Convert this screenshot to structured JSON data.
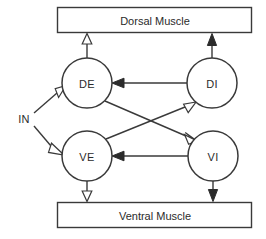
{
  "diagram": {
    "colors": {
      "stroke": "#3a3a3a",
      "fill": "#ffffff",
      "text": "#2b2b2b",
      "filled_arrow": "#2b2b2b"
    },
    "muscles": [
      {
        "id": "dorsal-muscle",
        "label": "Dorsal Muscle",
        "x": 57,
        "y": 7,
        "width": 195,
        "height": 26
      },
      {
        "id": "ventral-muscle",
        "label": "Ventral Muscle",
        "x": 57,
        "y": 202,
        "width": 195,
        "height": 26
      }
    ],
    "neurons": [
      {
        "id": "DE",
        "label": "DE",
        "cx": 87,
        "cy": 83,
        "r": 25
      },
      {
        "id": "DI",
        "label": "DI",
        "cx": 212,
        "cy": 83,
        "r": 25
      },
      {
        "id": "VE",
        "label": "VE",
        "cx": 87,
        "cy": 156,
        "r": 25
      },
      {
        "id": "VI",
        "label": "VI",
        "cx": 213,
        "cy": 156,
        "r": 25
      }
    ],
    "input": {
      "id": "IN",
      "label": "IN",
      "x": 24,
      "y": 119
    },
    "connections": [
      {
        "id": "de-to-dorsal-muscle",
        "from": "DE",
        "to": "dorsal-muscle",
        "arrow": "open",
        "direction": "up"
      },
      {
        "id": "di-to-dorsal-muscle",
        "from": "DI",
        "to": "dorsal-muscle",
        "arrow": "filled",
        "direction": "up"
      },
      {
        "id": "ve-to-ventral-muscle",
        "from": "VE",
        "to": "ventral-muscle",
        "arrow": "open",
        "direction": "down"
      },
      {
        "id": "vi-to-ventral-muscle",
        "from": "VI",
        "to": "ventral-muscle",
        "arrow": "filled",
        "direction": "down"
      },
      {
        "id": "in-to-de",
        "from": "IN",
        "to": "DE",
        "arrow": "open",
        "direction": "up-right"
      },
      {
        "id": "in-to-ve",
        "from": "IN",
        "to": "VE",
        "arrow": "open",
        "direction": "down-right"
      },
      {
        "id": "di-to-de",
        "from": "DI",
        "to": "DE",
        "arrow": "filled",
        "direction": "left"
      },
      {
        "id": "vi-to-ve",
        "from": "VI",
        "to": "VE",
        "arrow": "filled",
        "direction": "left"
      },
      {
        "id": "de-to-vi",
        "from": "DE",
        "to": "VI",
        "arrow": "open",
        "direction": "down-right"
      },
      {
        "id": "ve-to-di",
        "from": "VE",
        "to": "DI",
        "arrow": "open",
        "direction": "up-right"
      }
    ]
  }
}
